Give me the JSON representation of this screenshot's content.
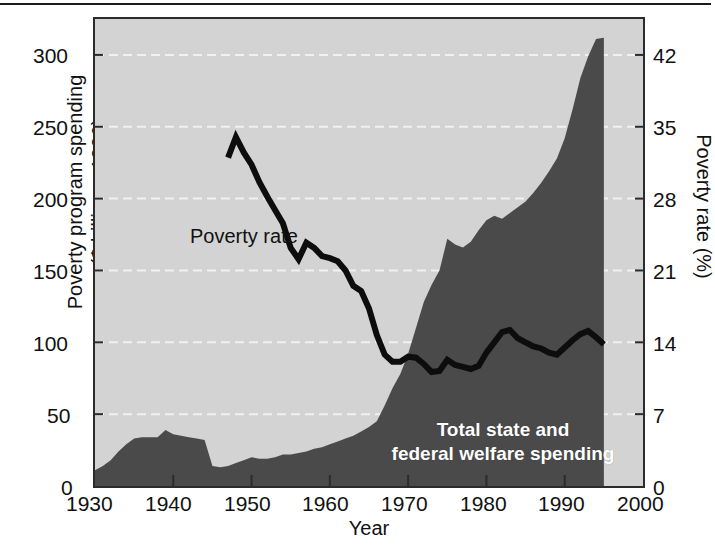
{
  "figure": {
    "background": "#ffffff",
    "plot_background": "#d3d3d3",
    "area_color": "#4a4a4a",
    "line_color": "#0d0d0d",
    "grid_color": "#f2f2f2",
    "axis_color": "#2b2b2b"
  },
  "chart_data": {
    "type": "area",
    "title": "",
    "subtitle": "",
    "xlabel": "Year",
    "ylabel": "Poverty program spending\n($ billions, 1996)",
    "ylabel_line1": "Poverty program spending",
    "ylabel_line2": "($ billions, 1996)",
    "y2label": "Poverty rate (%)",
    "xlim": [
      1930,
      2000
    ],
    "ylim": [
      0,
      325
    ],
    "y2lim": [
      0,
      45.5
    ],
    "grid": true,
    "grid_axis": "y",
    "legend": "inline-annotations",
    "xticks": [
      1930,
      1940,
      1950,
      1960,
      1970,
      1980,
      1990,
      2000
    ],
    "xticklabels": [
      "1930",
      "1940",
      "1950",
      "1960",
      "1970",
      "1980",
      "1990",
      "2000"
    ],
    "yticks": [
      0,
      50,
      100,
      150,
      200,
      250,
      300
    ],
    "yticklabels": [
      "0",
      "50",
      "100",
      "150",
      "200",
      "250",
      "300"
    ],
    "y2ticks": [
      0,
      7,
      14,
      21,
      28,
      35,
      42
    ],
    "y2ticklabels": [
      "0",
      "7",
      "14",
      "21",
      "28",
      "35",
      "42"
    ],
    "annotations": [
      {
        "name": "poverty-rate-label",
        "text": "Poverty rate",
        "x": 1949.2,
        "y": 168,
        "color": "#111111"
      },
      {
        "name": "welfare-spending-label",
        "text_line1": "Total state and",
        "text_line2": "federal welfare spending",
        "x": 1977,
        "y": 35,
        "color": "#ffffff"
      }
    ],
    "series": [
      {
        "name": "Total state and federal welfare spending",
        "kind": "area",
        "axis": "left",
        "units": "$ billions (1996 dollars)",
        "color": "#4a4a4a",
        "x": [
          1930,
          1931,
          1932,
          1933,
          1934,
          1935,
          1936,
          1937,
          1938,
          1939,
          1940,
          1941,
          1942,
          1943,
          1944,
          1945,
          1946,
          1947,
          1948,
          1949,
          1950,
          1951,
          1952,
          1953,
          1954,
          1955,
          1956,
          1957,
          1958,
          1959,
          1960,
          1961,
          1962,
          1963,
          1964,
          1965,
          1966,
          1967,
          1968,
          1969,
          1970,
          1971,
          1972,
          1973,
          1974,
          1975,
          1976,
          1977,
          1978,
          1979,
          1980,
          1981,
          1982,
          1983,
          1984,
          1985,
          1986,
          1987,
          1988,
          1989,
          1990,
          1991,
          1992,
          1993,
          1994,
          1995
        ],
        "values": [
          11,
          14,
          18,
          24,
          29,
          33,
          34,
          34,
          34,
          39,
          36,
          35,
          34,
          33,
          32,
          14,
          13,
          14,
          16,
          18,
          20,
          19,
          19,
          20,
          22,
          22,
          23,
          24,
          26,
          27,
          29,
          31,
          33,
          35,
          38,
          41,
          45,
          56,
          68,
          78,
          92,
          110,
          128,
          140,
          150,
          172,
          168,
          166,
          170,
          178,
          185,
          188,
          186,
          190,
          194,
          198,
          204,
          211,
          219,
          228,
          242,
          262,
          284,
          299,
          311,
          312
        ]
      },
      {
        "name": "Poverty rate",
        "kind": "line",
        "axis": "right",
        "units": "percent",
        "color": "#0d0d0d",
        "x": [
          1947,
          1948,
          1949,
          1950,
          1951,
          1952,
          1953,
          1954,
          1955,
          1956,
          1957,
          1958,
          1959,
          1960,
          1961,
          1962,
          1963,
          1964,
          1965,
          1966,
          1967,
          1968,
          1969,
          1970,
          1971,
          1972,
          1973,
          1974,
          1975,
          1976,
          1977,
          1978,
          1979,
          1980,
          1981,
          1982,
          1983,
          1984,
          1985,
          1986,
          1987,
          1988,
          1989,
          1990,
          1991,
          1992,
          1993,
          1994,
          1995
        ],
        "values": [
          32.0,
          34.0,
          32.5,
          31.3,
          29.6,
          28.2,
          26.9,
          25.6,
          23.2,
          22.1,
          23.7,
          23.2,
          22.4,
          22.2,
          21.9,
          21.0,
          19.5,
          19.0,
          17.3,
          14.7,
          12.8,
          12.1,
          12.1,
          12.6,
          12.5,
          11.9,
          11.1,
          11.2,
          12.3,
          11.8,
          11.6,
          11.4,
          11.7,
          13.0,
          14.0,
          15.0,
          15.2,
          14.4,
          14.0,
          13.6,
          13.4,
          13.0,
          12.8,
          13.5,
          14.2,
          14.8,
          15.1,
          14.5,
          13.8
        ]
      }
    ]
  }
}
